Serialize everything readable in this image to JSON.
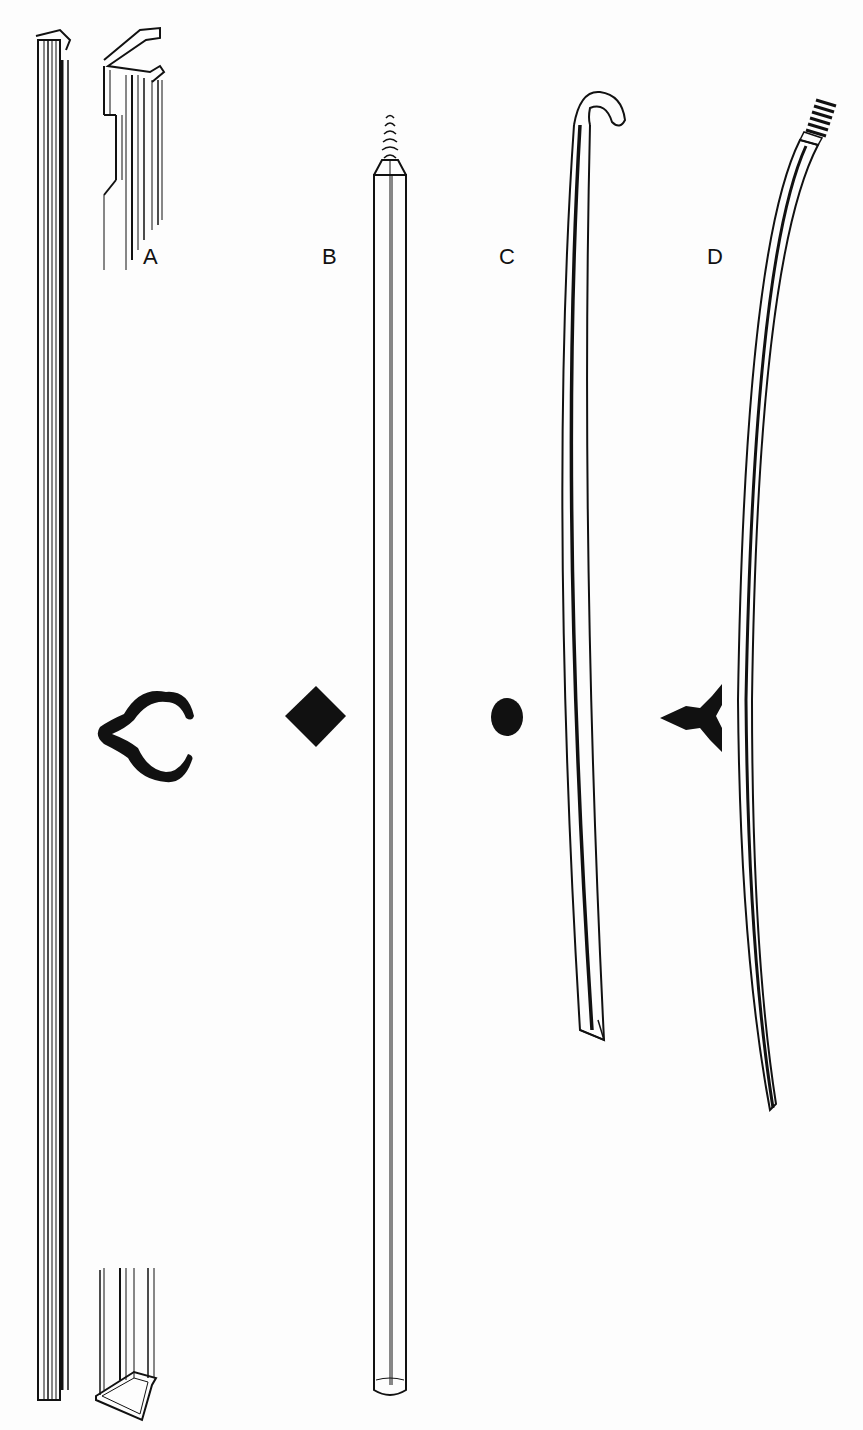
{
  "figure": {
    "labels": {
      "a": "A",
      "b": "B",
      "c": "C",
      "d": "D"
    },
    "items": [
      {
        "id": "A",
        "name": "channel rod with clip ends",
        "cross_section": "open C / lobed channel"
      },
      {
        "id": "B",
        "name": "straight rod with threaded tip",
        "cross_section": "diamond"
      },
      {
        "id": "C",
        "name": "curved hooked rod",
        "cross_section": "circle"
      },
      {
        "id": "D",
        "name": "curved rod with threaded tip",
        "cross_section": "three-lobed / tri-fin"
      }
    ],
    "colors": {
      "ink": "#111111",
      "paper": "#fdfdfd"
    }
  }
}
